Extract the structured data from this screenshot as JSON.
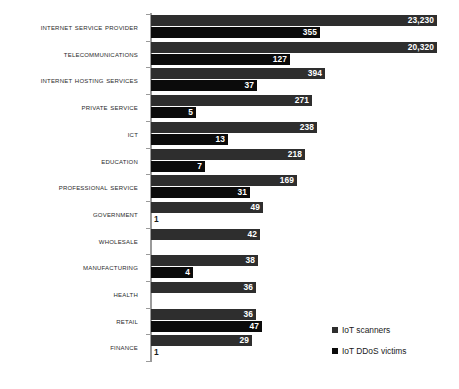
{
  "chart_data": {
    "type": "bar",
    "orientation": "horizontal",
    "title": "",
    "subtitle": "",
    "xlabel": "",
    "ylabel": "",
    "grid": false,
    "legend_position": "right-bottom",
    "categories": [
      "Internet Service Provider",
      "Telecommunications",
      "Internet Hosting Services",
      "Private Service",
      "ICT",
      "Education",
      "Professional Service",
      "Government",
      "Wholesale",
      "Manufacturing",
      "Health",
      "Retail",
      "Finance"
    ],
    "series": [
      {
        "name": "IoT scanners",
        "color": "#2e2e2e",
        "values": [
          23230,
          20320,
          394,
          271,
          238,
          218,
          169,
          49,
          42,
          38,
          36,
          36,
          29
        ],
        "value_labels": [
          "23,230",
          "20,320",
          "394",
          "271",
          "238",
          "218",
          "169",
          "49",
          "42",
          "38",
          "36",
          "36",
          "29"
        ]
      },
      {
        "name": "IoT DDoS victims",
        "color": "#0b0b0b",
        "values": [
          355,
          127,
          37,
          5,
          13,
          7,
          31,
          1,
          null,
          4,
          null,
          47,
          1
        ],
        "value_labels": [
          "355",
          "127",
          "37",
          "5",
          "13",
          "7",
          "31",
          "1",
          "",
          "4",
          "",
          "47",
          "1"
        ]
      }
    ],
    "bar_pixel_widths": {
      "scanners": [
        286,
        286,
        174,
        161,
        166,
        154,
        146,
        112,
        109,
        107,
        105,
        105,
        101
      ],
      "victims": [
        169,
        139,
        106,
        45,
        77,
        54,
        99,
        0,
        null,
        42,
        null,
        111,
        0
      ]
    }
  },
  "legend": {
    "items": [
      {
        "label": "IoT scanners",
        "color": "#2e2e2e"
      },
      {
        "label": "IoT DDoS victims",
        "color": "#0b0b0b"
      }
    ]
  }
}
